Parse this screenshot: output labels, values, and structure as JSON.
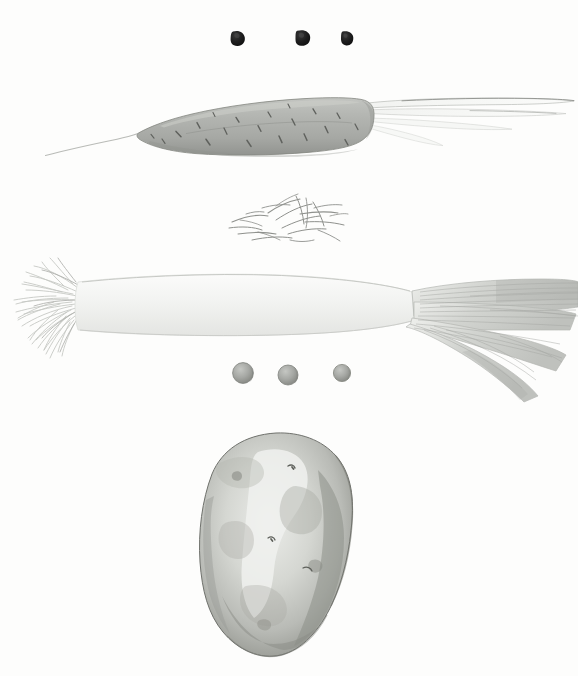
{
  "plate": {
    "title": "Vegetable Specimen Plate",
    "medium": "grayscale watercolour and pencil illustration",
    "background_color": "#fdfdfc",
    "width": 578,
    "height": 676,
    "specimen_count": 6
  },
  "palette": {
    "paper": "#fdfdfc",
    "seed_dark": "#1d1d1d",
    "carrot_body": "#b0b2ae",
    "carrot_shadow": "#8e918c",
    "carrot_mark": "#5f615d",
    "sprout_line": "#9a9c98",
    "leek_white": "#f4f5f3",
    "leek_leaf": "#c9cbc7",
    "leek_stripe": "#a7a9a5",
    "root_hair": "#c2c4c0",
    "pea_body": "#a8aaa6",
    "pea_shadow": "#7e817c",
    "potato_body": "#c4c6c1",
    "potato_light": "#e9eae7",
    "potato_dark": "#93958f",
    "potato_edge": "#6f716c"
  },
  "specimens": [
    {
      "id": "seeds-dark",
      "name": "dark seeds",
      "label": "Three dark seeds",
      "count": 3,
      "row": 1,
      "bbox": [
        230,
        28,
        124,
        20
      ],
      "items": [
        {
          "cx": 238,
          "cy": 38,
          "rx": 6.5,
          "ry": 7.5
        },
        {
          "cx": 303,
          "cy": 37,
          "rx": 7.0,
          "ry": 7.5
        },
        {
          "cx": 347,
          "cy": 38,
          "rx": 6.0,
          "ry": 7.0
        }
      ]
    },
    {
      "id": "carrot",
      "name": "carrot",
      "label": "Carrot with tapered tail and cut stems",
      "count": 1,
      "row": 2,
      "bbox": [
        45,
        92,
        530,
        72
      ],
      "tail_tip": [
        45,
        155
      ],
      "stem_count": 4
    },
    {
      "id": "sprouts",
      "name": "sprout tangle",
      "label": "Tangle of fine sprouts",
      "count": 1,
      "row": 3,
      "bbox": [
        226,
        194,
        120,
        48
      ]
    },
    {
      "id": "leek",
      "name": "leek",
      "label": "Leek with root beard and striated leaf blades",
      "count": 1,
      "row": 4,
      "bbox": [
        4,
        262,
        574,
        140
      ],
      "blade_count": 4
    },
    {
      "id": "peas-gray",
      "name": "gray peas",
      "label": "Three gray peas",
      "count": 3,
      "row": 5,
      "bbox": [
        230,
        361,
        120,
        22
      ],
      "items": [
        {
          "cx": 243,
          "cy": 373,
          "r": 10.5
        },
        {
          "cx": 288,
          "cy": 375,
          "r": 10.0
        },
        {
          "cx": 342,
          "cy": 373,
          "r": 8.5
        }
      ]
    },
    {
      "id": "potato",
      "name": "potato",
      "label": "Mottled potato tuber",
      "count": 1,
      "row": 6,
      "bbox": [
        199,
        432,
        155,
        226
      ],
      "eye_count": 3
    }
  ]
}
